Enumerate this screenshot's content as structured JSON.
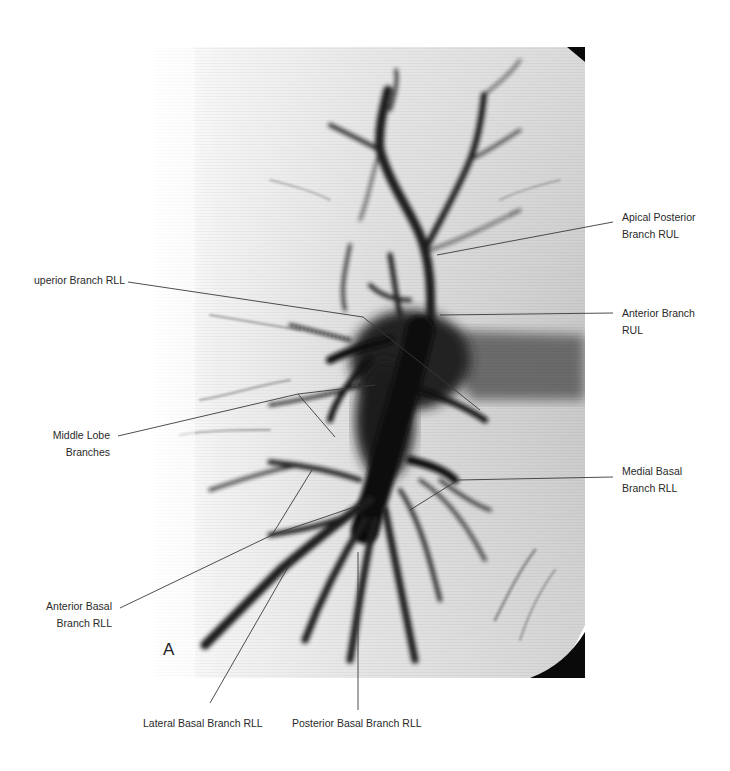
{
  "figure": {
    "panel_letter": "A",
    "labels": {
      "superior_branch_rll": "uperior Branch RLL",
      "apical_posterior_line1": "Apical Posterior",
      "apical_posterior_line2": "Branch RUL",
      "anterior_branch_line1": "Anterior Branch",
      "anterior_branch_line2": "RUL",
      "middle_lobe_line1": "Middle Lobe",
      "middle_lobe_line2": "Branches",
      "medial_basal_line1": "Medial Basal",
      "medial_basal_line2": "Branch RLL",
      "anterior_basal_line1": "Anterior Basal",
      "anterior_basal_line2": "Branch RLL",
      "lateral_basal": "Lateral Basal Branch RLL",
      "posterior_basal": "Posterior Basal Branch RLL"
    },
    "colors": {
      "background": "#ffffff",
      "film": "#d9d9d9",
      "vessel": "#111111",
      "leader_line": "#444444",
      "label_text": "#2a2a2a"
    }
  }
}
